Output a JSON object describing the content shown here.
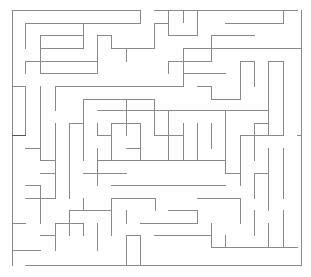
{
  "maze": {
    "width": 311,
    "height": 277,
    "wall_color": "#8a8a8a",
    "wall_dark_color": "#555555",
    "background": "#ffffff",
    "stroke_width": 1,
    "walls": [
      [
        12,
        10,
        140,
        10
      ],
      [
        154,
        10,
        297,
        10
      ],
      [
        12,
        10,
        12,
        265
      ],
      [
        301,
        10,
        301,
        265
      ],
      [
        25,
        265,
        301,
        265
      ],
      [
        140,
        10,
        140,
        22
      ],
      [
        168,
        10,
        168,
        35
      ],
      [
        25,
        23,
        140,
        23
      ],
      [
        25,
        23,
        25,
        48
      ],
      [
        154,
        23,
        154,
        48
      ],
      [
        154,
        23,
        168,
        23
      ],
      [
        183,
        10,
        183,
        22
      ],
      [
        225,
        23,
        283,
        23
      ],
      [
        283,
        10,
        283,
        23
      ],
      [
        40,
        35,
        83,
        35
      ],
      [
        40,
        35,
        40,
        48
      ],
      [
        40,
        48,
        83,
        48
      ],
      [
        83,
        23,
        83,
        48
      ],
      [
        97,
        35,
        97,
        61
      ],
      [
        97,
        35,
        111,
        35
      ],
      [
        111,
        35,
        111,
        48
      ],
      [
        111,
        48,
        154,
        48
      ],
      [
        211,
        35,
        254,
        35
      ],
      [
        211,
        35,
        211,
        48
      ],
      [
        168,
        35,
        197,
        35
      ],
      [
        197,
        10,
        197,
        35
      ],
      [
        197,
        48,
        211,
        48
      ],
      [
        126,
        48,
        126,
        61
      ],
      [
        183,
        48,
        183,
        86
      ],
      [
        183,
        48,
        197,
        48
      ],
      [
        211,
        48,
        301,
        48
      ],
      [
        211,
        48,
        211,
        61
      ],
      [
        25,
        61,
        40,
        61
      ],
      [
        25,
        61,
        25,
        73
      ],
      [
        40,
        48,
        40,
        73
      ],
      [
        40,
        73,
        97,
        73
      ],
      [
        97,
        61,
        97,
        73
      ],
      [
        40,
        61,
        97,
        61
      ],
      [
        168,
        61,
        211,
        61
      ],
      [
        168,
        61,
        168,
        73
      ],
      [
        240,
        61,
        240,
        86
      ],
      [
        240,
        61,
        254,
        61
      ],
      [
        254,
        61,
        254,
        86
      ],
      [
        268,
        61,
        283,
        61
      ],
      [
        268,
        61,
        268,
        135
      ],
      [
        283,
        61,
        283,
        135
      ],
      [
        183,
        73,
        225,
        73
      ],
      [
        183,
        73,
        183,
        86
      ],
      [
        197,
        86,
        211,
        86
      ],
      [
        211,
        86,
        211,
        99
      ],
      [
        211,
        99,
        240,
        99
      ],
      [
        240,
        86,
        240,
        99
      ],
      [
        12,
        86,
        25,
        86
      ],
      [
        25,
        86,
        25,
        135
      ],
      [
        40,
        86,
        40,
        160
      ],
      [
        55,
        86,
        55,
        110
      ],
      [
        55,
        86,
        183,
        86
      ],
      [
        83,
        99,
        154,
        99
      ],
      [
        83,
        99,
        83,
        160
      ],
      [
        154,
        99,
        154,
        110
      ],
      [
        97,
        110,
        268,
        110
      ],
      [
        126,
        99,
        126,
        135
      ],
      [
        154,
        110,
        154,
        135
      ],
      [
        168,
        110,
        168,
        160
      ],
      [
        111,
        123,
        140,
        123
      ],
      [
        111,
        123,
        111,
        160
      ],
      [
        140,
        123,
        140,
        148
      ],
      [
        154,
        135,
        183,
        135
      ],
      [
        183,
        123,
        183,
        160
      ],
      [
        126,
        148,
        140,
        148
      ],
      [
        140,
        148,
        140,
        160
      ],
      [
        97,
        123,
        97,
        135
      ],
      [
        97,
        135,
        111,
        135
      ],
      [
        197,
        123,
        197,
        160
      ],
      [
        211,
        123,
        211,
        148
      ],
      [
        225,
        110,
        225,
        160
      ],
      [
        254,
        123,
        254,
        160
      ],
      [
        254,
        123,
        268,
        123
      ],
      [
        240,
        135,
        283,
        135
      ],
      [
        240,
        135,
        240,
        148
      ],
      [
        297,
        135,
        301,
        135
      ],
      [
        12,
        135,
        25,
        135
      ],
      [
        25,
        148,
        40,
        148
      ],
      [
        55,
        123,
        55,
        198
      ],
      [
        40,
        160,
        55,
        160
      ],
      [
        69,
        123,
        69,
        198
      ],
      [
        69,
        123,
        83,
        123
      ],
      [
        83,
        173,
        126,
        173
      ],
      [
        97,
        148,
        97,
        185
      ],
      [
        97,
        160,
        225,
        160
      ],
      [
        225,
        160,
        225,
        173
      ],
      [
        111,
        185,
        225,
        185
      ],
      [
        240,
        148,
        240,
        185
      ],
      [
        225,
        173,
        240,
        173
      ],
      [
        283,
        148,
        283,
        198
      ],
      [
        268,
        148,
        268,
        210
      ],
      [
        254,
        173,
        254,
        198
      ],
      [
        254,
        173,
        268,
        173
      ],
      [
        40,
        173,
        55,
        173
      ],
      [
        25,
        185,
        40,
        185
      ],
      [
        40,
        185,
        40,
        223
      ],
      [
        25,
        198,
        55,
        198
      ],
      [
        69,
        210,
        111,
        210
      ],
      [
        69,
        210,
        69,
        235
      ],
      [
        83,
        198,
        83,
        210
      ],
      [
        111,
        198,
        155,
        198
      ],
      [
        111,
        198,
        111,
        235
      ],
      [
        126,
        210,
        126,
        223
      ],
      [
        140,
        223,
        197,
        223
      ],
      [
        155,
        198,
        155,
        210
      ],
      [
        197,
        198,
        240,
        198
      ],
      [
        240,
        198,
        240,
        223
      ],
      [
        168,
        210,
        197,
        210
      ],
      [
        197,
        210,
        197,
        223
      ],
      [
        55,
        223,
        83,
        223
      ],
      [
        55,
        223,
        55,
        250
      ],
      [
        83,
        223,
        83,
        235
      ],
      [
        97,
        223,
        97,
        250
      ],
      [
        126,
        235,
        126,
        265
      ],
      [
        140,
        235,
        140,
        265
      ],
      [
        126,
        235,
        140,
        235
      ],
      [
        154,
        235,
        211,
        235
      ],
      [
        211,
        223,
        211,
        247
      ],
      [
        211,
        247,
        297,
        247
      ],
      [
        225,
        235,
        225,
        247
      ],
      [
        254,
        210,
        254,
        235
      ],
      [
        268,
        223,
        268,
        247
      ],
      [
        283,
        210,
        283,
        247
      ],
      [
        12,
        223,
        25,
        223
      ],
      [
        12,
        250,
        25,
        250
      ],
      [
        25,
        250,
        40,
        250
      ],
      [
        40,
        235,
        55,
        235
      ]
    ],
    "dark_walls": [
      [
        12,
        135,
        25,
        135
      ]
    ]
  }
}
